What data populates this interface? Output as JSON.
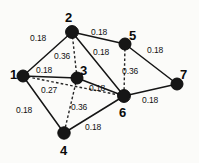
{
  "figure": {
    "background_color": "#fbfbf9",
    "node_color": "#161616",
    "edge_color": "#151515",
    "dashed_edge_color": "#262626"
  },
  "chart_data": {
    "type": "diagram",
    "title": "",
    "xlabel": "",
    "ylabel": "",
    "legend": [],
    "nodes": [
      {
        "id": "1",
        "label": "1",
        "x": 23,
        "y": 76,
        "r": 6.0,
        "label_x": 10,
        "label_y": 68
      },
      {
        "id": "2",
        "label": "2",
        "x": 72,
        "y": 32,
        "r": 6.4,
        "label_x": 65,
        "label_y": 11
      },
      {
        "id": "3",
        "label": "3",
        "x": 77,
        "y": 78,
        "r": 6.0,
        "label_x": 80,
        "label_y": 64
      },
      {
        "id": "4",
        "label": "4",
        "x": 64,
        "y": 133,
        "r": 6.2,
        "label_x": 60,
        "label_y": 144
      },
      {
        "id": "5",
        "label": "5",
        "x": 125,
        "y": 44,
        "r": 6.0,
        "label_x": 129,
        "label_y": 29
      },
      {
        "id": "6",
        "label": "6",
        "x": 124,
        "y": 96,
        "r": 6.4,
        "label_x": 119,
        "label_y": 106
      },
      {
        "id": "7",
        "label": "7",
        "x": 177,
        "y": 84,
        "r": 6.0,
        "label_x": 180,
        "label_y": 68
      }
    ],
    "edges": [
      {
        "source": "1",
        "target": "2",
        "weight": "0.18",
        "style": "solid",
        "label_x": 30,
        "label_y": 34
      },
      {
        "source": "1",
        "target": "3",
        "weight": "0.18",
        "style": "solid",
        "label_x": 36,
        "label_y": 66
      },
      {
        "source": "1",
        "target": "4",
        "weight": "0.18",
        "style": "solid",
        "label_x": 16,
        "label_y": 106
      },
      {
        "source": "2",
        "target": "5",
        "weight": "0.18",
        "style": "solid",
        "label_x": 91,
        "label_y": 28
      },
      {
        "source": "2",
        "target": "6",
        "weight": "0.18",
        "style": "solid",
        "label_x": 93,
        "label_y": 48
      },
      {
        "source": "3",
        "target": "6",
        "weight": "0.18",
        "style": "solid",
        "label_x": 89,
        "label_y": 84
      },
      {
        "source": "4",
        "target": "6",
        "weight": "0.18",
        "style": "solid",
        "label_x": 85,
        "label_y": 123
      },
      {
        "source": "5",
        "target": "7",
        "weight": "0.18",
        "style": "solid",
        "label_x": 147,
        "label_y": 46
      },
      {
        "source": "6",
        "target": "7",
        "weight": "0.18",
        "style": "solid",
        "label_x": 142,
        "label_y": 96
      },
      {
        "source": "2",
        "target": "3",
        "weight": "0.36",
        "style": "dashed",
        "label_x": 54,
        "label_y": 52
      },
      {
        "source": "1",
        "target": "6",
        "weight": "0.27",
        "style": "dashed",
        "label_x": 41,
        "label_y": 86
      },
      {
        "source": "3",
        "target": "4",
        "weight": "0.36",
        "style": "dashed",
        "label_x": 71,
        "label_y": 103
      },
      {
        "source": "5",
        "target": "6",
        "weight": "0.36",
        "style": "dashed",
        "label_x": 122,
        "label_y": 67
      }
    ]
  }
}
